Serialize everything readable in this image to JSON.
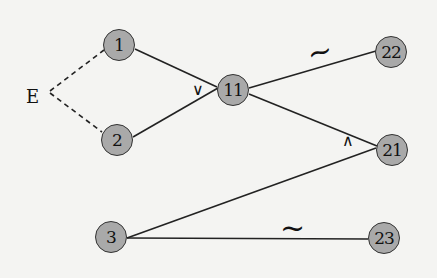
{
  "diagram": {
    "type": "graph",
    "background": "#f4f4f2",
    "node_fill": "#a9a9a9",
    "nodes": [
      {
        "id": "1",
        "label": "1",
        "x": 119,
        "y": 45
      },
      {
        "id": "2",
        "label": "2",
        "x": 117,
        "y": 140
      },
      {
        "id": "3",
        "label": "3",
        "x": 111,
        "y": 237
      },
      {
        "id": "11",
        "label": "11",
        "x": 233,
        "y": 90
      },
      {
        "id": "22",
        "label": "22",
        "x": 391,
        "y": 52
      },
      {
        "id": "21",
        "label": "21",
        "x": 392,
        "y": 150
      },
      {
        "id": "23",
        "label": "23",
        "x": 384,
        "y": 238
      }
    ],
    "start_label": {
      "text": "E",
      "x": 34,
      "y": 97
    },
    "edges": [
      {
        "from": "E",
        "to": "1",
        "style": "dashed"
      },
      {
        "from": "E",
        "to": "2",
        "style": "dashed"
      },
      {
        "from": "1",
        "to": "11",
        "style": "solid"
      },
      {
        "from": "2",
        "to": "11",
        "style": "solid"
      },
      {
        "from": "11",
        "to": "22",
        "style": "solid",
        "mark": "~"
      },
      {
        "from": "11",
        "to": "21",
        "style": "solid"
      },
      {
        "from": "3",
        "to": "21",
        "style": "solid"
      },
      {
        "from": "3",
        "to": "23",
        "style": "solid",
        "mark": "~"
      }
    ],
    "annotations": [
      {
        "text": "∨",
        "x": 197,
        "y": 92,
        "meaning": "or"
      },
      {
        "text": "∧",
        "x": 347,
        "y": 143,
        "meaning": "and"
      },
      {
        "text": "~",
        "x": 320,
        "y": 55
      },
      {
        "text": "~",
        "x": 296,
        "y": 232
      }
    ]
  }
}
